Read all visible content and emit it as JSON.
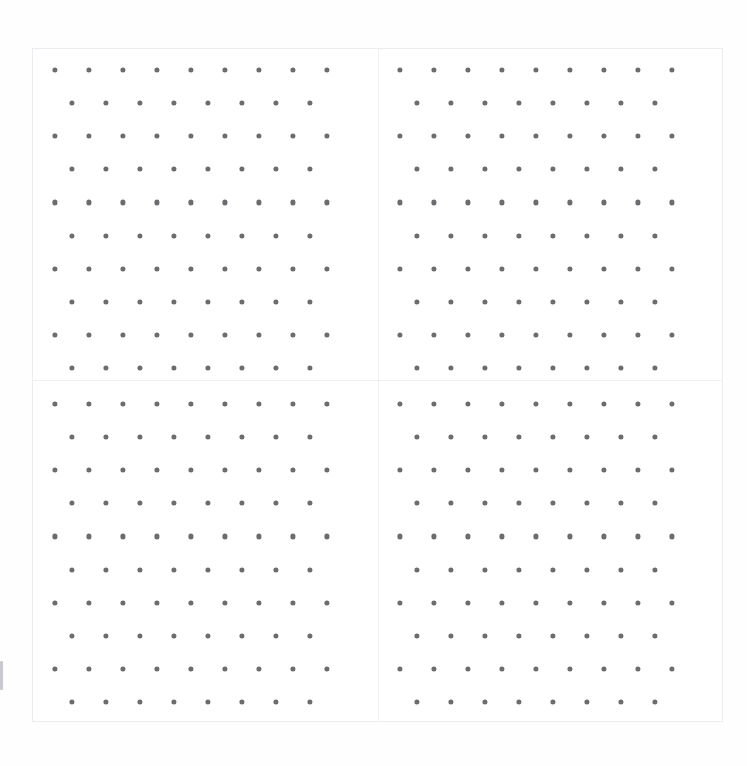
{
  "figure": {
    "width": 747,
    "height": 766,
    "background_color": "#ffffff",
    "paper_tint_color": "#fefeff",
    "title": "",
    "subtitle": ""
  },
  "axes_frame": {
    "label": "outer-axes-frame",
    "x": 32,
    "y": 48,
    "width": 691,
    "height": 674,
    "border_color": "#ececf0",
    "border_width": 1,
    "face_color": "#ffffff"
  },
  "dividers": {
    "color": "#f0f0f3",
    "vertical_x": [
      378
    ],
    "horizontal_y": [
      380
    ]
  },
  "dot_style": {
    "color": "#6b6b70",
    "radius": 2.6,
    "diameter": 5.2,
    "marker": "circle"
  },
  "edge_tick": {
    "label": "left-edge-tick-mark",
    "x": 0,
    "y": 661,
    "width": 3,
    "height": 29,
    "color": "#c9c9cf"
  },
  "lattice": {
    "description": "staggered (offset / hexagonal) dot lattice",
    "rows": 10,
    "dots_per_aligned_row": 9,
    "dots_per_offset_row": 8,
    "x_pitch": 34.0,
    "y_pitch": 33.1,
    "x_offset_fraction": 0.5,
    "first_row_alignment": "aligned"
  },
  "panels": [
    {
      "name": "panel-top-left",
      "x": 33,
      "y": 49,
      "width": 345,
      "height": 331,
      "origin_x": 55,
      "origin_y": 70,
      "rows": 10,
      "row_types": [
        "aligned",
        "offset",
        "aligned",
        "offset",
        "aligned",
        "offset",
        "aligned",
        "offset",
        "aligned",
        "offset"
      ],
      "row_counts": [
        9,
        8,
        9,
        8,
        9,
        8,
        9,
        8,
        9,
        8
      ]
    },
    {
      "name": "panel-top-right",
      "x": 379,
      "y": 49,
      "width": 344,
      "height": 331,
      "origin_x": 400,
      "origin_y": 70,
      "rows": 10,
      "row_types": [
        "aligned",
        "offset",
        "aligned",
        "offset",
        "aligned",
        "offset",
        "aligned",
        "offset",
        "aligned",
        "offset"
      ],
      "row_counts": [
        9,
        8,
        9,
        8,
        9,
        8,
        9,
        8,
        9,
        8
      ]
    },
    {
      "name": "panel-bottom-left",
      "x": 33,
      "y": 381,
      "width": 345,
      "height": 341,
      "origin_x": 55,
      "origin_y": 404,
      "rows": 10,
      "row_types": [
        "aligned",
        "offset",
        "aligned",
        "offset",
        "aligned",
        "offset",
        "aligned",
        "offset",
        "aligned",
        "offset"
      ],
      "row_counts": [
        9,
        8,
        9,
        8,
        9,
        8,
        9,
        8,
        9,
        8
      ]
    },
    {
      "name": "panel-bottom-right",
      "x": 379,
      "y": 381,
      "width": 344,
      "height": 341,
      "origin_x": 400,
      "origin_y": 404,
      "rows": 10,
      "row_types": [
        "aligned",
        "offset",
        "aligned",
        "offset",
        "aligned",
        "offset",
        "aligned",
        "offset",
        "aligned",
        "offset"
      ],
      "row_counts": [
        9,
        8,
        9,
        8,
        9,
        8,
        9,
        8,
        9,
        8
      ]
    }
  ],
  "chart_data": {
    "type": "scatter",
    "title": "",
    "subtitle": "",
    "xlabel": "",
    "ylabel": "",
    "grid": false,
    "legend": null,
    "legend_position": "none",
    "axis_ticks_visible": false,
    "tick_labels_x": [],
    "tick_labels_y": [],
    "xlim": [
      0,
      1
    ],
    "ylim": [
      0,
      1
    ],
    "subplot_layout": {
      "rows": 2,
      "cols": 2,
      "shared_x": true,
      "shared_y": true
    },
    "marker_color": "#6b6b70",
    "marker_size": 5.2,
    "annotations": [],
    "series": [
      {
        "name": "panel-top-left",
        "subplot": [
          0,
          0
        ],
        "point_count": 85,
        "x": [
          0.0,
          0.125,
          0.25,
          0.375,
          0.5,
          0.625,
          0.75,
          0.875,
          1.0,
          0.063,
          0.188,
          0.313,
          0.438,
          0.563,
          0.688,
          0.813,
          0.938,
          0.0,
          0.125,
          0.25,
          0.375,
          0.5,
          0.625,
          0.75,
          0.875,
          1.0,
          0.063,
          0.188,
          0.313,
          0.438,
          0.563,
          0.688,
          0.813,
          0.938,
          0.0,
          0.125,
          0.25,
          0.375,
          0.5,
          0.625,
          0.75,
          0.875,
          1.0,
          0.063,
          0.188,
          0.313,
          0.438,
          0.563,
          0.688,
          0.813,
          0.938,
          0.0,
          0.125,
          0.25,
          0.375,
          0.5,
          0.625,
          0.75,
          0.875,
          1.0,
          0.063,
          0.188,
          0.313,
          0.438,
          0.563,
          0.688,
          0.813,
          0.938,
          0.0,
          0.125,
          0.25,
          0.375,
          0.5,
          0.625,
          0.75,
          0.875,
          1.0,
          0.063,
          0.188,
          0.313,
          0.438,
          0.563,
          0.688,
          0.813,
          0.938
        ],
        "y": [
          1.0,
          1.0,
          1.0,
          1.0,
          1.0,
          1.0,
          1.0,
          1.0,
          1.0,
          0.889,
          0.889,
          0.889,
          0.889,
          0.889,
          0.889,
          0.889,
          0.889,
          0.778,
          0.778,
          0.778,
          0.778,
          0.778,
          0.778,
          0.778,
          0.778,
          0.778,
          0.667,
          0.667,
          0.667,
          0.667,
          0.667,
          0.667,
          0.667,
          0.667,
          0.556,
          0.556,
          0.556,
          0.556,
          0.556,
          0.556,
          0.556,
          0.556,
          0.556,
          0.444,
          0.444,
          0.444,
          0.444,
          0.444,
          0.444,
          0.444,
          0.444,
          0.333,
          0.333,
          0.333,
          0.333,
          0.333,
          0.333,
          0.333,
          0.333,
          0.333,
          0.222,
          0.222,
          0.222,
          0.222,
          0.222,
          0.222,
          0.222,
          0.222,
          0.111,
          0.111,
          0.111,
          0.111,
          0.111,
          0.111,
          0.111,
          0.111,
          0.111,
          0.0,
          0.0,
          0.0,
          0.0,
          0.0,
          0.0,
          0.0,
          0.0
        ]
      },
      {
        "name": "panel-top-right",
        "subplot": [
          0,
          1
        ],
        "point_count": 85
      },
      {
        "name": "panel-bottom-left",
        "subplot": [
          1,
          0
        ],
        "point_count": 85
      },
      {
        "name": "panel-bottom-right",
        "subplot": [
          1,
          1
        ],
        "point_count": 85
      }
    ]
  }
}
